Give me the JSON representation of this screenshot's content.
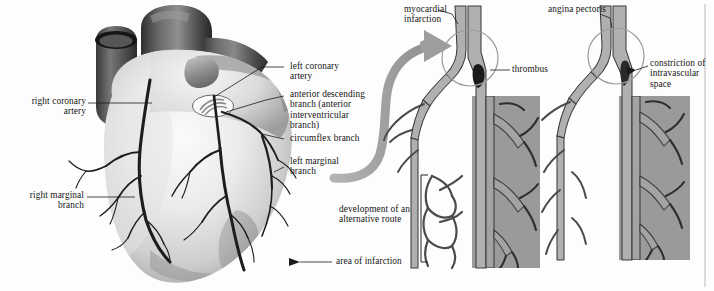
{
  "figure": {
    "kind": "medical-anatomy-illustration",
    "background_color": "#fdfdfd",
    "ink_color": "#151515",
    "ischemia_fill": "#9a9a9a",
    "vessel_fill": "#a8a8a8",
    "vessel_stroke": "#3a3a3a",
    "arrow_color": "#9d9d9d"
  },
  "heart_panel": {
    "labels_left": [
      {
        "id": "right-coronary-artery",
        "text": "right coronary\nartery"
      },
      {
        "id": "right-marginal-branch",
        "text": "right marginal\nbranch"
      }
    ],
    "labels_right": [
      {
        "id": "left-coronary-artery",
        "text": "left coronary\nartery"
      },
      {
        "id": "anterior-descending-branch",
        "text": "anterior descending\nbranch (anterior\ninterventricular\nbranch)"
      },
      {
        "id": "circumflex-branch",
        "text": "circumflex branch"
      },
      {
        "id": "left-marginal-branch",
        "text": "left marginal\nbranch"
      }
    ],
    "labels_bottom": [
      {
        "id": "area-of-infarction",
        "text": "area of infarction"
      }
    ]
  },
  "detail_panels": [
    {
      "id": "myocardial-infarction",
      "title": "myocardial\ninfarction",
      "callouts": [
        {
          "id": "thrombus",
          "text": "thrombus"
        }
      ],
      "bracket_label": "development of an\nalternative route"
    },
    {
      "id": "angina-pectoris",
      "title": "angina pectoris",
      "callouts": [
        {
          "id": "constriction-of-intravascular-space",
          "text": "constriction of\nintravascular\nspace"
        }
      ],
      "bracket_label": ""
    }
  ]
}
